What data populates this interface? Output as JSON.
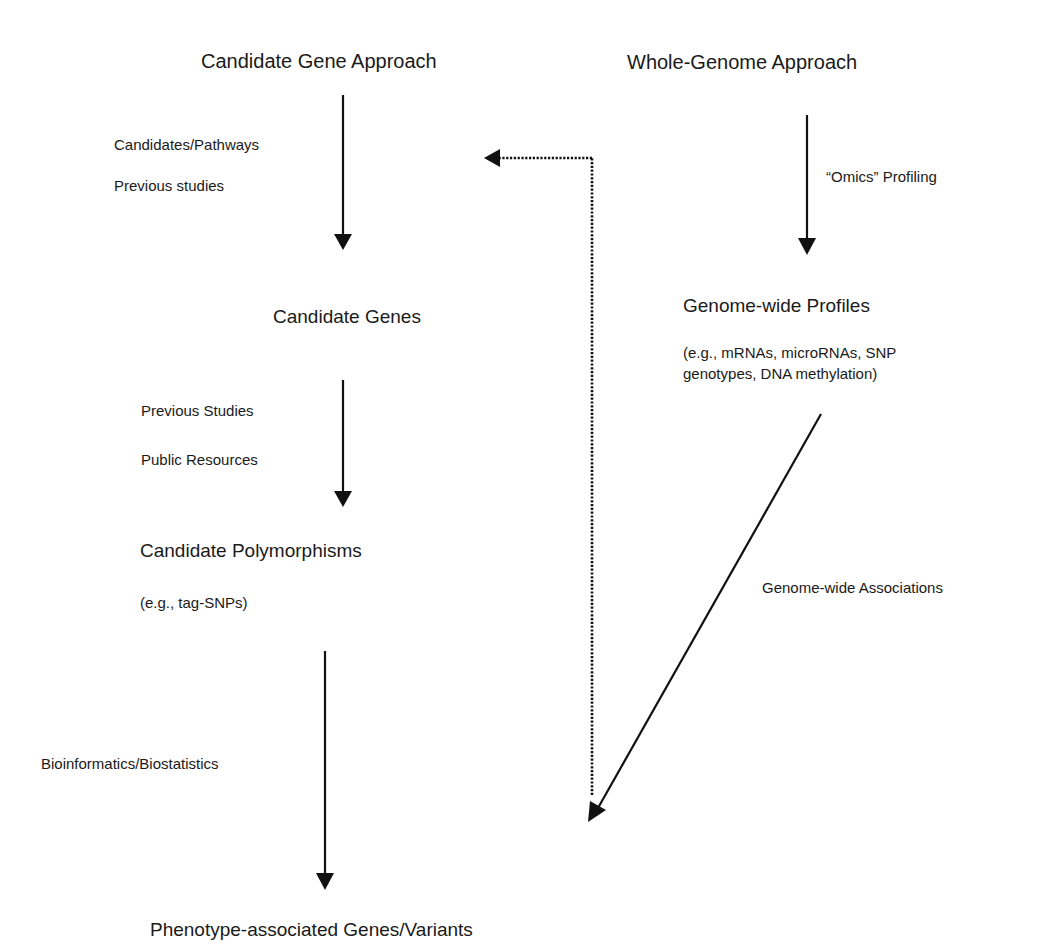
{
  "diagram": {
    "left_column": {
      "title": "Candidate Gene Approach",
      "step1_notes": [
        "Candidates/Pathways",
        "Previous studies"
      ],
      "node1": "Candidate Genes",
      "step2_notes": [
        "Previous Studies",
        "Public Resources"
      ],
      "node2": "Candidate Polymorphisms",
      "node2_example": "(e.g., tag-SNPs)",
      "step3_note": "Bioinformatics/Biostatistics"
    },
    "right_column": {
      "title": "Whole-Genome Approach",
      "step1_note": "“Omics” Profiling",
      "node1": "Genome-wide Profiles",
      "node1_example_line1": "(e.g., mRNAs, microRNAs, SNP",
      "node1_example_line2": "genotypes, DNA methylation)",
      "step2_note": "Genome-wide Associations"
    },
    "result": "Phenotype-associated Genes/Variants",
    "edges": [
      {
        "from": "Candidate Gene Approach",
        "to": "Candidate Genes",
        "style": "solid",
        "label": "Candidates/Pathways; Previous studies"
      },
      {
        "from": "Candidate Genes",
        "to": "Candidate Polymorphisms",
        "style": "solid",
        "label": "Previous Studies; Public Resources"
      },
      {
        "from": "Candidate Polymorphisms",
        "to": "Phenotype-associated Genes/Variants",
        "style": "solid",
        "label": "Bioinformatics/Biostatistics"
      },
      {
        "from": "Whole-Genome Approach",
        "to": "Genome-wide Profiles",
        "style": "solid",
        "label": "“Omics” Profiling"
      },
      {
        "from": "Genome-wide Profiles",
        "to": "Phenotype-associated Genes/Variants",
        "style": "solid",
        "label": "Genome-wide Associations"
      },
      {
        "from": "Phenotype-associated Genes/Variants",
        "to": "Candidate Gene Approach",
        "style": "dotted",
        "label": ""
      }
    ],
    "colors": {
      "ink": "#111111",
      "background": "#ffffff"
    }
  }
}
